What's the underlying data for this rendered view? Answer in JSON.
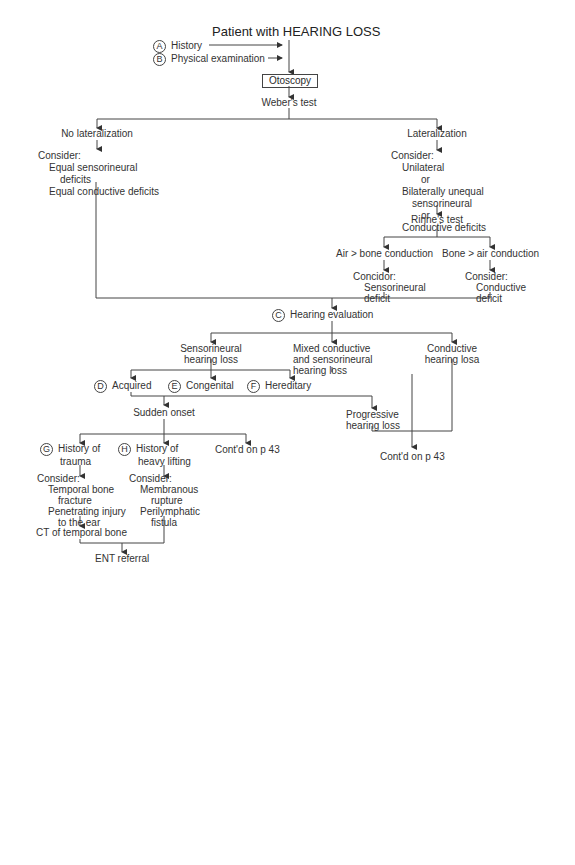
{
  "title": "Patient with HEARING LOSS",
  "inputs": [
    {
      "badge": "A",
      "label": "History"
    },
    {
      "badge": "B",
      "label": "Physical examination"
    }
  ],
  "otoscopy": "Otoscopy",
  "weber": "Weber's test",
  "no_lateralization": {
    "label": "No lateralization",
    "consider": "Consider:",
    "items": [
      "Equal sensorineural",
      "deficits",
      "Equal conductive deficits"
    ]
  },
  "lateralization": {
    "label": "Lateralization",
    "consider": "Consider:",
    "items": [
      "Unilateral",
      "or",
      "Bilaterally unequal",
      "sensorineural",
      "or",
      "Conductive deficits"
    ]
  },
  "rinne": "Rinne's test",
  "air_bone": {
    "label": "Air > bone conduction",
    "consider": "Concidor:",
    "items": [
      "Sensorineural",
      "deficit"
    ]
  },
  "bone_air": {
    "label": "Bone > air conduction",
    "consider": "Consider:",
    "items": [
      "Conductive",
      "deficit"
    ]
  },
  "hearing_eval": {
    "badge": "C",
    "label": "Hearing evaluation"
  },
  "sensorineural": [
    "Sensorineural",
    "hearing loss"
  ],
  "mixed": [
    "Mixed conductive",
    "and sensorineural",
    "hearing loss"
  ],
  "conductive": [
    "Conductive",
    "hearing losa"
  ],
  "causes": [
    {
      "badge": "D",
      "label": "Acquired"
    },
    {
      "badge": "E",
      "label": "Congenital"
    },
    {
      "badge": "F",
      "label": "Hereditary"
    }
  ],
  "sudden_onset": "Sudden onset",
  "progressive": [
    "Progressive",
    "hearing loss"
  ],
  "trauma": {
    "badge": "G",
    "lines": [
      "History of",
      "trauma"
    ]
  },
  "lifting": {
    "badge": "H",
    "lines": [
      "History of",
      "heavy lifting"
    ]
  },
  "contd_1": "Cont'd on p 43",
  "contd_2": "Cont'd on p 43",
  "trauma_consider": {
    "consider": "Consider:",
    "items": [
      "Temporal bone",
      "fracture",
      "Penetrating injury",
      "to the ear"
    ]
  },
  "lifting_consider": {
    "consider": "Consider:",
    "items": [
      "Membranous",
      "rupture",
      "Perilymphatic",
      "fistula"
    ]
  },
  "ct": "CT of temporal bone",
  "ent": "ENT referral"
}
